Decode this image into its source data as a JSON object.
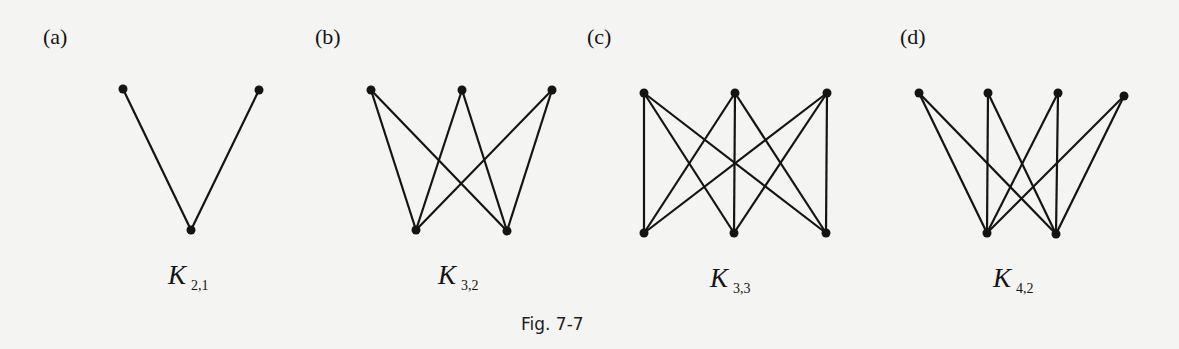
{
  "figure": {
    "caption": "Fig. 7-7",
    "stroke_color": "#141414",
    "background_color": "#f4f4f2"
  },
  "panels": [
    {
      "label": "(a)",
      "graph_letter": "K",
      "graph_subscript": "2,1",
      "label_pos": [
        55,
        38
      ],
      "name_pos": [
        168,
        262
      ],
      "top_vertices": [
        [
          123,
          89
        ],
        [
          259,
          90
        ]
      ],
      "bottom_vertices": [
        [
          191,
          230
        ]
      ]
    },
    {
      "label": "(b)",
      "graph_letter": "K",
      "graph_subscript": "3,2",
      "label_pos": [
        327,
        38
      ],
      "name_pos": [
        438,
        262
      ],
      "top_vertices": [
        [
          371,
          90
        ],
        [
          462,
          90
        ],
        [
          552,
          90
        ]
      ],
      "bottom_vertices": [
        [
          416,
          230
        ],
        [
          507,
          231
        ]
      ]
    },
    {
      "label": "(c)",
      "graph_letter": "K",
      "graph_subscript": "3,3",
      "label_pos": [
        599,
        38
      ],
      "name_pos": [
        710,
        265
      ],
      "top_vertices": [
        [
          644,
          93
        ],
        [
          735,
          93
        ],
        [
          827,
          93
        ]
      ],
      "bottom_vertices": [
        [
          644,
          233
        ],
        [
          734,
          233
        ],
        [
          826,
          233
        ]
      ]
    },
    {
      "label": "(d)",
      "graph_letter": "K",
      "graph_subscript": "4,2",
      "label_pos": [
        912,
        38
      ],
      "name_pos": [
        993,
        265
      ],
      "top_vertices": [
        [
          919,
          93
        ],
        [
          988,
          93
        ],
        [
          1058,
          93
        ],
        [
          1124,
          96
        ]
      ],
      "bottom_vertices": [
        [
          987,
          233
        ],
        [
          1056,
          234
        ]
      ]
    }
  ],
  "caption_pos": [
    521,
    316
  ]
}
